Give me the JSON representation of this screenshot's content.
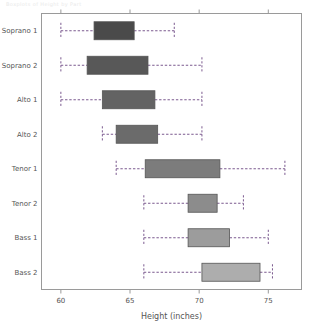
{
  "figure": {
    "faint_header": "Boxplots of Height by Part",
    "background_color": "#ffffff",
    "frame_color": "#9a9a9a",
    "axis_text_color": "#555555",
    "whisker_color": "#7b5a8f",
    "box_border_color": "#555555"
  },
  "chart_data": {
    "type": "box",
    "orientation": "horizontal",
    "title": "",
    "xlabel": "Height (inches)",
    "ylabel": "",
    "xlim": [
      58.6,
      77.4
    ],
    "xticks": [
      60,
      65,
      70,
      75
    ],
    "xtick_labels": [
      "60",
      "65",
      "70",
      "75"
    ],
    "grid": false,
    "legend": null,
    "categories": [
      "Soprano 1",
      "Soprano 2",
      "Alto 1",
      "Alto 2",
      "Tenor 1",
      "Tenor 2",
      "Bass 1",
      "Bass 2"
    ],
    "boxes": [
      {
        "label": "Soprano 1",
        "whisker_low": 60.0,
        "q1": 62.4,
        "median": 64.0,
        "q3": 65.3,
        "whisker_high": 68.2,
        "fill": "#4a4a4a"
      },
      {
        "label": "Soprano 2",
        "whisker_low": 60.0,
        "q1": 61.9,
        "median": 64.0,
        "q3": 66.3,
        "whisker_high": 70.2,
        "fill": "#585858"
      },
      {
        "label": "Alto 1",
        "whisker_low": 60.0,
        "q1": 63.0,
        "median": 65.0,
        "q3": 66.8,
        "whisker_high": 70.2,
        "fill": "#636363"
      },
      {
        "label": "Alto 2",
        "whisker_low": 63.0,
        "q1": 64.0,
        "median": 65.5,
        "q3": 67.0,
        "whisker_high": 70.2,
        "fill": "#6b6b6b"
      },
      {
        "label": "Tenor 1",
        "whisker_low": 64.0,
        "q1": 66.1,
        "median": 69.0,
        "q3": 71.5,
        "whisker_high": 76.2,
        "fill": "#7c7c7c"
      },
      {
        "label": "Tenor 2",
        "whisker_low": 66.0,
        "q1": 69.2,
        "median": 70.3,
        "q3": 71.3,
        "whisker_high": 73.2,
        "fill": "#8c8c8c"
      },
      {
        "label": "Bass 1",
        "whisker_low": 66.0,
        "q1": 69.2,
        "median": 70.8,
        "q3": 72.2,
        "whisker_high": 75.0,
        "fill": "#9c9c9c"
      },
      {
        "label": "Bass 2",
        "whisker_low": 66.0,
        "q1": 70.2,
        "median": 72.3,
        "q3": 74.4,
        "whisker_high": 75.3,
        "fill": "#adadad"
      }
    ]
  }
}
